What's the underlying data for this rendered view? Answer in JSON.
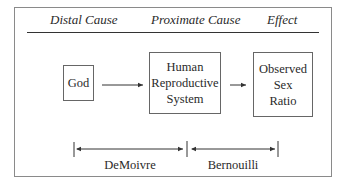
{
  "headers": {
    "distal": "Distal Cause",
    "proximate": "Proximate Cause",
    "effect": "Effect"
  },
  "boxes": {
    "god": [
      "God"
    ],
    "human": [
      "Human",
      "Reproductive",
      "System"
    ],
    "observed": [
      "Observed",
      "Sex",
      "Ratio"
    ]
  },
  "spans": {
    "left": "DeMoivre",
    "right": "Bernouilli"
  }
}
